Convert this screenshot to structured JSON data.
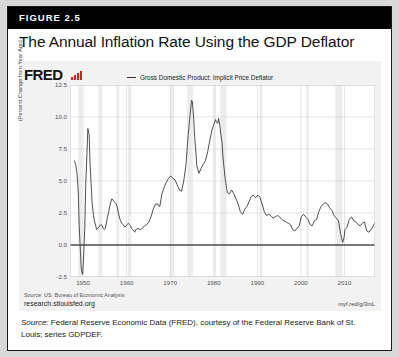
{
  "figure": {
    "number_label": "FIGURE 2.5",
    "title": "The Annual Inflation Rate Using the GDP Deflator",
    "caption_lead": "Source:",
    "caption_text": " Federal Reserve Economic Data (FRED), courtesy of the Federal Reserve Bank of St. Louis; series GDPDEF."
  },
  "chart_panel": {
    "brand": "FRED",
    "brand_mark_icon": "red-bar-chart-icon",
    "source_note": "Source: US. Bureau of Economic Analysis",
    "source_url": "research.stlouisfed.org",
    "short_url": "myf.red/g/3inL"
  },
  "colors": {
    "header_bar": "#000000",
    "page_background": "#d8d8d8",
    "panel_background": "#f2f2f2",
    "plot_background": "#ffffff",
    "line": "#3c3c3c",
    "zero_line": "#000000",
    "gridline": "#d9d9d9",
    "recession_band": "#ececec",
    "brand_mark": "#cc2222"
  },
  "chart_data": {
    "type": "line",
    "title": "The Annual Inflation Rate Using the GDP Deflator",
    "xlabel": "",
    "ylabel": "(Percent Change from Year Ago)",
    "legend": [
      "Gross Domestic Product: Implicit Price Deflator"
    ],
    "legend_position": "top-center",
    "grid": true,
    "xlim": [
      1947,
      2017
    ],
    "ylim": [
      -2.5,
      12.5
    ],
    "xticks": [
      1950,
      1960,
      1970,
      1980,
      1990,
      2000,
      2010
    ],
    "yticks": [
      -2.5,
      0.0,
      2.5,
      5.0,
      7.5,
      10.0,
      12.5
    ],
    "ytick_labels": [
      "-2.5",
      "0.0",
      "2.5",
      "5.0",
      "7.5",
      "10.0",
      "12.5"
    ],
    "xtick_labels": [
      "1950",
      "1960",
      "1970",
      "1980",
      "1990",
      "2000",
      "2010"
    ],
    "zero_reference_line": 0.0,
    "recession_bands": [
      [
        1948.9,
        1949.8
      ],
      [
        1953.5,
        1954.4
      ],
      [
        1957.6,
        1958.3
      ],
      [
        1960.3,
        1961.1
      ],
      [
        1969.9,
        1970.9
      ],
      [
        1973.9,
        1975.2
      ],
      [
        1980.0,
        1980.5
      ],
      [
        1981.5,
        1982.9
      ],
      [
        1990.5,
        1991.2
      ],
      [
        2001.2,
        2001.8
      ],
      [
        2007.9,
        2009.5
      ]
    ],
    "series": [
      {
        "name": "Gross Domestic Product: Implicit Price Deflator",
        "x": [
          1948.0,
          1948.3,
          1948.6,
          1948.9,
          1949.1,
          1949.4,
          1949.6,
          1949.9,
          1950.1,
          1950.4,
          1950.6,
          1950.9,
          1951.1,
          1951.4,
          1951.6,
          1951.9,
          1952.1,
          1952.4,
          1952.6,
          1952.9,
          1953.1,
          1953.4,
          1953.6,
          1953.9,
          1954.1,
          1954.4,
          1954.6,
          1954.9,
          1955.1,
          1955.4,
          1955.6,
          1955.9,
          1956.1,
          1956.4,
          1956.6,
          1956.9,
          1957.1,
          1957.4,
          1957.6,
          1957.9,
          1958.1,
          1958.4,
          1958.6,
          1958.9,
          1959.1,
          1959.4,
          1959.6,
          1959.9,
          1960.1,
          1960.4,
          1960.6,
          1960.9,
          1961.1,
          1961.4,
          1961.6,
          1961.9,
          1962.1,
          1962.6,
          1963.1,
          1963.6,
          1964.1,
          1964.6,
          1965.1,
          1965.6,
          1966.1,
          1966.6,
          1967.1,
          1967.6,
          1968.1,
          1968.6,
          1969.1,
          1969.6,
          1970.1,
          1970.6,
          1971.1,
          1971.6,
          1972.1,
          1972.6,
          1973.1,
          1973.6,
          1974.1,
          1974.4,
          1974.6,
          1974.9,
          1975.1,
          1975.4,
          1975.6,
          1975.9,
          1976.1,
          1976.6,
          1977.1,
          1977.6,
          1978.1,
          1978.6,
          1979.1,
          1979.6,
          1980.1,
          1980.4,
          1980.6,
          1980.9,
          1981.1,
          1981.4,
          1981.6,
          1981.9,
          1982.1,
          1982.6,
          1983.1,
          1983.6,
          1984.1,
          1984.6,
          1985.1,
          1985.6,
          1986.1,
          1986.6,
          1987.1,
          1987.6,
          1988.1,
          1988.6,
          1989.1,
          1989.6,
          1990.1,
          1990.6,
          1991.1,
          1991.6,
          1992.1,
          1992.6,
          1993.1,
          1993.6,
          1994.1,
          1994.6,
          1995.1,
          1995.6,
          1996.1,
          1996.6,
          1997.1,
          1997.6,
          1998.1,
          1998.6,
          1999.1,
          1999.6,
          2000.1,
          2000.6,
          2001.1,
          2001.6,
          2002.1,
          2002.6,
          2003.1,
          2003.6,
          2004.1,
          2004.6,
          2005.1,
          2005.6,
          2006.1,
          2006.6,
          2007.1,
          2007.6,
          2008.1,
          2008.6,
          2009.1,
          2009.4,
          2009.6,
          2009.9,
          2010.1,
          2010.6,
          2011.1,
          2011.6,
          2012.1,
          2012.6,
          2013.1,
          2013.6,
          2014.1,
          2014.6,
          2015.1,
          2015.6,
          2016.1,
          2016.6,
          2017.1
        ],
        "y": [
          6.6,
          6.3,
          5.6,
          4.2,
          1.6,
          -0.6,
          -1.9,
          -2.3,
          -1.1,
          1.4,
          4.6,
          7.3,
          9.1,
          8.6,
          6.4,
          4.4,
          3.2,
          2.3,
          1.9,
          1.5,
          1.2,
          1.3,
          1.4,
          1.5,
          1.6,
          1.5,
          1.3,
          1.2,
          1.3,
          1.8,
          2.2,
          2.6,
          3.0,
          3.4,
          3.6,
          3.5,
          3.4,
          3.3,
          3.2,
          2.9,
          2.5,
          2.1,
          1.9,
          1.7,
          1.6,
          1.5,
          1.4,
          1.5,
          1.6,
          1.7,
          1.6,
          1.5,
          1.3,
          1.2,
          1.1,
          1.0,
          1.2,
          1.3,
          1.2,
          1.3,
          1.5,
          1.6,
          1.8,
          2.2,
          2.8,
          3.2,
          3.2,
          3.0,
          4.0,
          4.5,
          4.9,
          5.2,
          5.4,
          5.2,
          5.1,
          4.7,
          4.3,
          4.2,
          5.0,
          6.2,
          8.5,
          9.6,
          10.3,
          11.3,
          11.2,
          9.8,
          8.5,
          7.2,
          6.2,
          5.6,
          6.0,
          6.3,
          6.6,
          7.3,
          8.2,
          9.0,
          9.5,
          9.8,
          9.6,
          9.5,
          9.9,
          9.3,
          8.7,
          8.0,
          6.9,
          5.2,
          4.1,
          4.0,
          4.3,
          4.0,
          3.6,
          3.2,
          2.6,
          2.4,
          2.8,
          3.0,
          3.4,
          3.8,
          3.9,
          3.7,
          3.9,
          3.7,
          3.2,
          2.6,
          2.3,
          2.4,
          2.3,
          2.1,
          2.2,
          2.3,
          2.2,
          2.0,
          1.9,
          1.8,
          1.7,
          1.6,
          1.2,
          1.1,
          1.3,
          1.5,
          2.2,
          2.4,
          2.2,
          2.0,
          1.6,
          1.5,
          1.9,
          2.0,
          2.6,
          3.0,
          3.2,
          3.3,
          3.2,
          2.9,
          2.7,
          2.3,
          2.1,
          1.9,
          0.9,
          0.4,
          0.2,
          0.6,
          1.2,
          1.4,
          2.0,
          2.2,
          1.9,
          1.8,
          1.6,
          1.5,
          1.7,
          1.8,
          1.1,
          1.0,
          1.2,
          1.5,
          1.8
        ],
        "color": "#3c3c3c",
        "peak_1951": 9.1,
        "peak_1975": 11.3,
        "peak_1981": 9.9,
        "trough_1949": -2.3,
        "trough_2009": 0.2
      }
    ]
  }
}
